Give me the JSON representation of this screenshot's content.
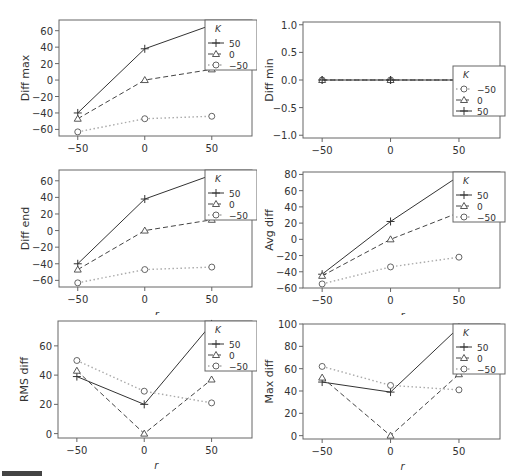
{
  "figure": {
    "legend_title": "K",
    "x_label": "r",
    "x_ticks": [
      -50,
      0,
      50
    ]
  },
  "chart_data": [
    {
      "type": "line",
      "id": "diff-max",
      "ylabel": "Diff max",
      "xlabel": "r",
      "x": [
        -50,
        0,
        50
      ],
      "ylim": [
        -68,
        73
      ],
      "yticks": [
        -60,
        -40,
        -20,
        0,
        20,
        40,
        60
      ],
      "legend_order": [
        "50",
        "0",
        "-50"
      ],
      "legend_position": "top-right",
      "series": [
        {
          "name": "50",
          "marker": "plus",
          "style": "solid",
          "values": [
            -40,
            38,
            67
          ]
        },
        {
          "name": "0",
          "marker": "triangle",
          "style": "dashed",
          "values": [
            -47,
            0,
            13
          ]
        },
        {
          "name": "-50",
          "marker": "circle",
          "style": "dotted",
          "values": [
            -63,
            -47,
            -44
          ]
        }
      ]
    },
    {
      "type": "line",
      "id": "diff-min",
      "ylabel": "Diff min",
      "xlabel": "r",
      "x": [
        -50,
        0,
        50
      ],
      "ylim": [
        -1.05,
        1.05
      ],
      "yticks": [
        -1.0,
        -0.5,
        0.0,
        0.5,
        1.0
      ],
      "ytick_labels": [
        "-1.0",
        "-0.5",
        "0.0",
        "0.5",
        "1.0"
      ],
      "legend_order": [
        "-50",
        "0",
        "50"
      ],
      "legend_position": "center-right",
      "series": [
        {
          "name": "-50",
          "marker": "circle",
          "style": "dotted",
          "values": [
            0,
            0,
            0
          ]
        },
        {
          "name": "0",
          "marker": "triangle",
          "style": "dashed",
          "values": [
            0,
            0,
            0
          ]
        },
        {
          "name": "50",
          "marker": "plus",
          "style": "solid",
          "values": [
            0,
            0,
            0
          ]
        }
      ]
    },
    {
      "type": "line",
      "id": "diff-end",
      "ylabel": "Diff end",
      "xlabel": "r",
      "x": [
        -50,
        0,
        50
      ],
      "ylim": [
        -68,
        73
      ],
      "yticks": [
        -60,
        -40,
        -20,
        0,
        20,
        40,
        60
      ],
      "legend_order": [
        "50",
        "0",
        "-50"
      ],
      "legend_position": "top-right",
      "series": [
        {
          "name": "50",
          "marker": "plus",
          "style": "solid",
          "values": [
            -40,
            38,
            67
          ]
        },
        {
          "name": "0",
          "marker": "triangle",
          "style": "dashed",
          "values": [
            -47,
            0,
            13
          ]
        },
        {
          "name": "-50",
          "marker": "circle",
          "style": "dotted",
          "values": [
            -63,
            -47,
            -44
          ]
        }
      ]
    },
    {
      "type": "line",
      "id": "avg-diff",
      "ylabel": "Avg diff",
      "xlabel": "r",
      "x": [
        -50,
        0,
        50
      ],
      "ylim": [
        -60,
        83
      ],
      "yticks": [
        -60,
        -40,
        -20,
        0,
        20,
        40,
        60,
        80
      ],
      "legend_order": [
        "50",
        "0",
        "-50"
      ],
      "legend_position": "top-right",
      "series": [
        {
          "name": "50",
          "marker": "plus",
          "style": "solid",
          "values": [
            -43,
            22,
            78
          ]
        },
        {
          "name": "0",
          "marker": "triangle",
          "style": "dashed",
          "values": [
            -45,
            0,
            33
          ]
        },
        {
          "name": "-50",
          "marker": "circle",
          "style": "dotted",
          "values": [
            -55,
            -34,
            -22
          ]
        }
      ]
    },
    {
      "type": "line",
      "id": "rms-diff",
      "ylabel": "RMS diff",
      "xlabel": "r",
      "x": [
        -50,
        0,
        50
      ],
      "ylim": [
        -3,
        77
      ],
      "yticks": [
        0,
        20,
        40,
        60
      ],
      "legend_order": [
        "50",
        "0",
        "-50"
      ],
      "legend_position": "top-right",
      "series": [
        {
          "name": "50",
          "marker": "plus",
          "style": "solid",
          "values": [
            39,
            20,
            75
          ]
        },
        {
          "name": "0",
          "marker": "triangle",
          "style": "dashed",
          "values": [
            43,
            0,
            37
          ]
        },
        {
          "name": "-50",
          "marker": "circle",
          "style": "dotted",
          "values": [
            50,
            29,
            21
          ]
        }
      ]
    },
    {
      "type": "line",
      "id": "max-diff",
      "ylabel": "Max diff",
      "xlabel": "r",
      "x": [
        -50,
        0,
        50
      ],
      "ylim": [
        -3,
        100
      ],
      "yticks": [
        0,
        20,
        40,
        60,
        80,
        100
      ],
      "legend_order": [
        "50",
        "0",
        "-50"
      ],
      "legend_position": "top-right",
      "series": [
        {
          "name": "50",
          "marker": "plus",
          "style": "solid",
          "values": [
            48,
            39,
            97
          ]
        },
        {
          "name": "0",
          "marker": "triangle",
          "style": "dashed",
          "values": [
            52,
            0,
            55
          ]
        },
        {
          "name": "-50",
          "marker": "circle",
          "style": "dotted",
          "values": [
            62,
            45,
            41
          ]
        }
      ]
    }
  ]
}
